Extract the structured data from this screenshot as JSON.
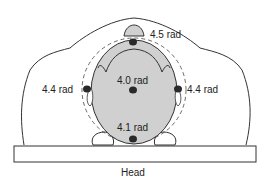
{
  "diagram": {
    "caption": "Head",
    "colors": {
      "outline": "#333333",
      "head_fill": "#d0d0d0",
      "dot": "#2a2a2a",
      "table_fill": "#ffffff",
      "background": "#ffffff"
    },
    "measurements": [
      {
        "id": "top",
        "label": "4.5 rad",
        "position": "forehead/nose"
      },
      {
        "id": "center",
        "label": "4.0 rad",
        "position": "center of head"
      },
      {
        "id": "left",
        "label": "4.4 rad",
        "position": "left ear"
      },
      {
        "id": "right",
        "label": "4.4 rad",
        "position": "right ear"
      },
      {
        "id": "bottom",
        "label": "4.1 rad",
        "position": "back of head / table contact"
      }
    ]
  }
}
